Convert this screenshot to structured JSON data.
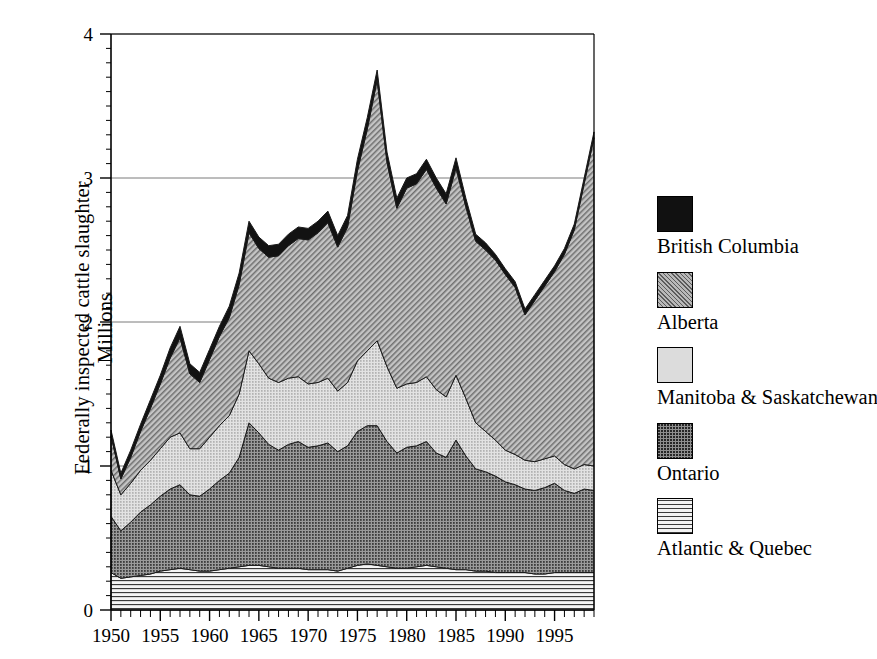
{
  "chart_data": {
    "type": "area",
    "stacked": true,
    "title": "",
    "subtitle": "",
    "xlabel": "",
    "ylabel": "Federally inspected cattle slaughter",
    "ylabel_line2": "Millions",
    "ylim": [
      0,
      4
    ],
    "xlim": [
      1950,
      1999
    ],
    "y_ticks": [
      "0",
      "1",
      "2",
      "3",
      "4"
    ],
    "y_tick_values": [
      0,
      1,
      2,
      3,
      4
    ],
    "y_minor_tick_step": 0.1,
    "x_ticks": [
      "1950",
      "1955",
      "1960",
      "1965",
      "1970",
      "1975",
      "1980",
      "1985",
      "1990",
      "1995"
    ],
    "x_tick_values": [
      1950,
      1955,
      1960,
      1965,
      1970,
      1975,
      1980,
      1985,
      1990,
      1995
    ],
    "x_minor_tick_step": 1,
    "grid": "horizontal-major-only",
    "legend_position": "right",
    "x": [
      1950,
      1951,
      1952,
      1953,
      1954,
      1955,
      1956,
      1957,
      1958,
      1959,
      1960,
      1961,
      1962,
      1963,
      1964,
      1965,
      1966,
      1967,
      1968,
      1969,
      1970,
      1971,
      1972,
      1973,
      1974,
      1975,
      1976,
      1977,
      1978,
      1979,
      1980,
      1981,
      1982,
      1983,
      1984,
      1985,
      1986,
      1987,
      1988,
      1989,
      1990,
      1991,
      1992,
      1993,
      1994,
      1995,
      1996,
      1997,
      1998,
      1999
    ],
    "series": [
      {
        "name": "Atlantic & Quebec",
        "fill": "horizontal-lines",
        "values": [
          0.26,
          0.22,
          0.23,
          0.24,
          0.25,
          0.27,
          0.28,
          0.29,
          0.28,
          0.27,
          0.27,
          0.28,
          0.29,
          0.3,
          0.31,
          0.31,
          0.3,
          0.29,
          0.29,
          0.29,
          0.28,
          0.28,
          0.28,
          0.27,
          0.29,
          0.31,
          0.32,
          0.31,
          0.3,
          0.29,
          0.29,
          0.3,
          0.31,
          0.3,
          0.29,
          0.28,
          0.28,
          0.27,
          0.27,
          0.26,
          0.26,
          0.26,
          0.26,
          0.25,
          0.25,
          0.26,
          0.26,
          0.26,
          0.26,
          0.26
        ]
      },
      {
        "name": "Ontario",
        "fill": "dark-dotted",
        "values": [
          0.39,
          0.33,
          0.38,
          0.44,
          0.48,
          0.52,
          0.56,
          0.58,
          0.52,
          0.52,
          0.57,
          0.62,
          0.66,
          0.76,
          0.99,
          0.92,
          0.85,
          0.82,
          0.86,
          0.88,
          0.85,
          0.86,
          0.88,
          0.83,
          0.85,
          0.93,
          0.96,
          0.97,
          0.87,
          0.8,
          0.84,
          0.84,
          0.86,
          0.79,
          0.77,
          0.9,
          0.79,
          0.71,
          0.69,
          0.67,
          0.63,
          0.61,
          0.58,
          0.58,
          0.6,
          0.62,
          0.57,
          0.55,
          0.58,
          0.57
        ]
      },
      {
        "name": "Manitoba & Saskatchewan",
        "fill": "light-dotted",
        "values": [
          0.32,
          0.25,
          0.27,
          0.29,
          0.31,
          0.33,
          0.36,
          0.36,
          0.32,
          0.33,
          0.36,
          0.38,
          0.4,
          0.44,
          0.5,
          0.48,
          0.46,
          0.47,
          0.46,
          0.45,
          0.44,
          0.44,
          0.45,
          0.42,
          0.44,
          0.49,
          0.52,
          0.59,
          0.52,
          0.45,
          0.44,
          0.44,
          0.45,
          0.44,
          0.42,
          0.45,
          0.4,
          0.32,
          0.28,
          0.25,
          0.22,
          0.21,
          0.2,
          0.2,
          0.2,
          0.19,
          0.18,
          0.17,
          0.17,
          0.17
        ]
      },
      {
        "name": "Alberta",
        "fill": "diagonal-hatch",
        "values": [
          0.24,
          0.11,
          0.18,
          0.27,
          0.36,
          0.45,
          0.55,
          0.66,
          0.52,
          0.46,
          0.54,
          0.62,
          0.68,
          0.76,
          0.82,
          0.8,
          0.84,
          0.88,
          0.92,
          0.96,
          1.0,
          1.04,
          1.08,
          1.0,
          1.08,
          1.32,
          1.54,
          1.81,
          1.42,
          1.25,
          1.36,
          1.38,
          1.44,
          1.4,
          1.34,
          1.44,
          1.33,
          1.26,
          1.26,
          1.25,
          1.22,
          1.16,
          1.01,
          1.12,
          1.2,
          1.28,
          1.46,
          1.66,
          1.95,
          2.28
        ]
      },
      {
        "name": "British Columbia",
        "fill": "solid-black",
        "values": [
          0.04,
          0.04,
          0.05,
          0.05,
          0.06,
          0.06,
          0.07,
          0.08,
          0.07,
          0.07,
          0.07,
          0.07,
          0.08,
          0.08,
          0.08,
          0.08,
          0.08,
          0.08,
          0.08,
          0.08,
          0.08,
          0.08,
          0.08,
          0.08,
          0.08,
          0.08,
          0.08,
          0.07,
          0.07,
          0.07,
          0.07,
          0.07,
          0.07,
          0.07,
          0.07,
          0.07,
          0.06,
          0.05,
          0.05,
          0.04,
          0.04,
          0.04,
          0.04,
          0.04,
          0.04,
          0.04,
          0.04,
          0.04,
          0.04,
          0.04
        ]
      }
    ],
    "totals": [
      1.25,
      0.95,
      1.11,
      1.29,
      1.46,
      1.63,
      1.82,
      1.97,
      1.71,
      1.65,
      1.81,
      1.97,
      2.11,
      2.34,
      2.7,
      2.59,
      2.53,
      2.54,
      2.61,
      2.66,
      2.65,
      2.7,
      2.77,
      2.6,
      2.74,
      3.13,
      3.42,
      3.75,
      3.18,
      2.86,
      3.0,
      3.03,
      3.13,
      3.0,
      2.89,
      3.14,
      2.86,
      2.61,
      2.55,
      2.47,
      2.37,
      2.28,
      2.09,
      2.19,
      2.29,
      2.39,
      2.51,
      2.68,
      3.0,
      3.32
    ]
  },
  "legend": {
    "items": [
      {
        "label": "British Columbia",
        "swatch": "sw-bc",
        "name": "legend-swatch-british-columbia"
      },
      {
        "label": "Alberta",
        "swatch": "sw-ab",
        "name": "legend-swatch-alberta"
      },
      {
        "label": "Manitoba & Saskatchewan",
        "swatch": "sw-mbsk",
        "name": "legend-swatch-manitoba-saskatchewan"
      },
      {
        "label": "Ontario",
        "swatch": "sw-on",
        "name": "legend-swatch-ontario"
      },
      {
        "label": "Atlantic & Quebec",
        "swatch": "sw-atq",
        "name": "legend-swatch-atlantic-quebec"
      }
    ]
  },
  "axis": {
    "y_title_line1": "Federally inspected cattle slaughter",
    "y_title_line2": "Millions"
  },
  "colors": {
    "british_columbia": "#111111",
    "alberta": "#b8b8b8",
    "manitoba_saskatchewan": "#dcdcdc",
    "ontario": "#8e8e8e",
    "atlantic_quebec": "#f2f2f2",
    "axis": "#000000",
    "grid": "#777777",
    "background": "#ffffff"
  }
}
